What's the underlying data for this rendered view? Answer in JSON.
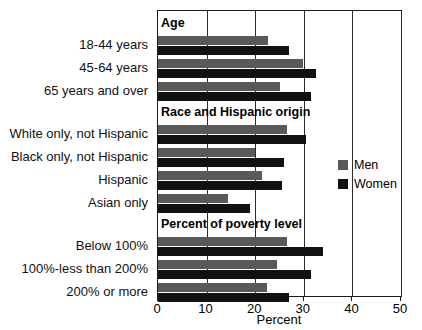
{
  "chart_data": {
    "type": "bar",
    "orientation": "horizontal",
    "title": "",
    "xlabel": "Percent",
    "ylabel": "",
    "xlim": [
      0,
      50
    ],
    "xticks": [
      0,
      10,
      20,
      30,
      40,
      50
    ],
    "xticklabels": [
      "0",
      "10",
      "20",
      "30",
      "40",
      "50"
    ],
    "grid": true,
    "legend_position": "right-middle",
    "colors": {
      "men": "#595959",
      "women": "#111111",
      "frame": "#1a1a1a",
      "background": "#ffffff"
    },
    "legend": [
      {
        "name": "Men",
        "color": "#595959"
      },
      {
        "name": "Women",
        "color": "#111111"
      }
    ],
    "series": [
      {
        "name": "Men",
        "values": [
          22.7,
          29.8,
          25.0,
          26.5,
          20.0,
          21.5,
          14.5,
          26.5,
          24.5,
          22.5
        ]
      },
      {
        "name": "Women",
        "values": [
          27.0,
          32.5,
          31.5,
          30.5,
          26.0,
          25.5,
          19.0,
          34.0,
          31.5,
          27.0
        ]
      }
    ],
    "categories": [
      "18-44 years",
      "45-64 years",
      "65 years and over",
      "White only, not Hispanic",
      "Black only, not Hispanic",
      "Hispanic",
      "Asian only",
      "Below 100%",
      "100%-less than 200%",
      "200% or more"
    ],
    "sections": [
      {
        "label": "Age",
        "categories": [
          "18-44 years",
          "45-64 years",
          "65 years and over"
        ]
      },
      {
        "label": "Race and Hispanic origin",
        "categories": [
          "White only, not Hispanic",
          "Black only, not Hispanic",
          "Hispanic",
          "Asian only"
        ]
      },
      {
        "label": "Percent of poverty level",
        "categories": [
          "Below 100%",
          "100%-less than 200%",
          "200% or more"
        ]
      }
    ]
  }
}
